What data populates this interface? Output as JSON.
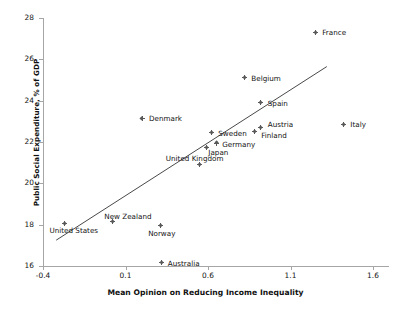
{
  "chart_data": {
    "type": "scatter",
    "title": "",
    "xlabel": "Mean Opinion on Reducing Income Inequality",
    "ylabel": "Public Social Expenditure, % of GDP",
    "xlim": [
      -0.4,
      1.6
    ],
    "ylim": [
      16,
      28
    ],
    "xticks": [
      "-0.4",
      "0.1",
      "0.6",
      "1.1",
      "1.6"
    ],
    "yticks": [
      "16",
      "18",
      "20",
      "22",
      "24",
      "26",
      "28"
    ],
    "grid": false,
    "legend": "none",
    "marker_color": "#595959",
    "trendline_color": "#333333",
    "series": [
      {
        "name": "countries",
        "points": [
          {
            "label": "France",
            "x": 1.25,
            "y": 27.3,
            "label_dx": 7,
            "label_dy": -3
          },
          {
            "label": "Belgium",
            "x": 0.82,
            "y": 25.1,
            "label_dx": 7,
            "label_dy": -3
          },
          {
            "label": "Spain",
            "x": 0.92,
            "y": 23.9,
            "label_dx": 7,
            "label_dy": -3
          },
          {
            "label": "Denmark",
            "x": 0.2,
            "y": 23.15,
            "label_dx": 7,
            "label_dy": -3
          },
          {
            "label": "Italy",
            "x": 1.42,
            "y": 22.85,
            "label_dx": 7,
            "label_dy": -3
          },
          {
            "label": "Austria",
            "x": 0.92,
            "y": 22.7,
            "label_dx": 7,
            "label_dy": -7
          },
          {
            "label": "Finland",
            "x": 0.88,
            "y": 22.5,
            "label_dx": 7,
            "label_dy": 0
          },
          {
            "label": "Sweden",
            "x": 0.62,
            "y": 22.45,
            "label_dx": 7,
            "label_dy": -3
          },
          {
            "label": "Germany",
            "x": 0.65,
            "y": 21.95,
            "label_dx": 6,
            "label_dy": -2
          },
          {
            "label": "Japan",
            "x": 0.59,
            "y": 21.75,
            "label_dx": 2,
            "label_dy": 2
          },
          {
            "label": "United Kingdom",
            "x": 0.55,
            "y": 20.9,
            "label_dx": -34,
            "label_dy": -10
          },
          {
            "label": "New Zealand",
            "x": 0.02,
            "y": 18.15,
            "label_dx": -8,
            "label_dy": -9
          },
          {
            "label": "United States",
            "x": -0.27,
            "y": 18.05,
            "label_dx": -15,
            "label_dy": 3
          },
          {
            "label": "Norway",
            "x": 0.31,
            "y": 17.95,
            "label_dx": -12,
            "label_dy": 4
          },
          {
            "label": "Australia",
            "x": 0.32,
            "y": 16.15,
            "label_dx": 6,
            "label_dy": -3
          }
        ]
      }
    ],
    "trendline": {
      "x0": -0.32,
      "y0": 17.25,
      "x1": 1.32,
      "y1": 25.65
    }
  }
}
